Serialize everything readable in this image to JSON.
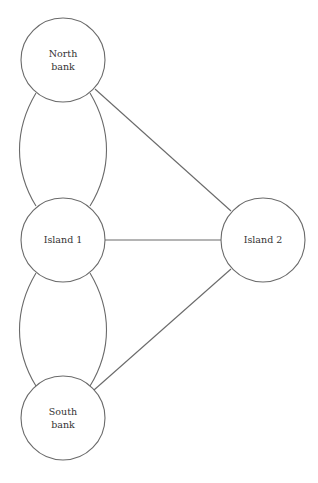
{
  "diagram": {
    "type": "graph",
    "title": "",
    "nodes": [
      {
        "id": "north",
        "label_lines": [
          "North",
          "bank"
        ],
        "cx": 63,
        "cy": 60,
        "r": 42
      },
      {
        "id": "island1",
        "label_lines": [
          "Island 1"
        ],
        "cx": 63,
        "cy": 240,
        "r": 42
      },
      {
        "id": "island2",
        "label_lines": [
          "Island 2"
        ],
        "cx": 263,
        "cy": 240,
        "r": 42
      },
      {
        "id": "south",
        "label_lines": [
          "South",
          "bank"
        ],
        "cx": 63,
        "cy": 418,
        "r": 42
      }
    ],
    "edges": [
      {
        "from": "north",
        "to": "island1",
        "shape": "curve-left"
      },
      {
        "from": "north",
        "to": "island1",
        "shape": "curve-right"
      },
      {
        "from": "north",
        "to": "island2",
        "shape": "straight"
      },
      {
        "from": "island1",
        "to": "island2",
        "shape": "straight"
      },
      {
        "from": "island1",
        "to": "south",
        "shape": "curve-left"
      },
      {
        "from": "island1",
        "to": "south",
        "shape": "curve-right"
      },
      {
        "from": "south",
        "to": "island2",
        "shape": "straight"
      }
    ],
    "colors": {
      "stroke": "#6a6a6a",
      "text": "#333333",
      "background": "#ffffff"
    }
  }
}
